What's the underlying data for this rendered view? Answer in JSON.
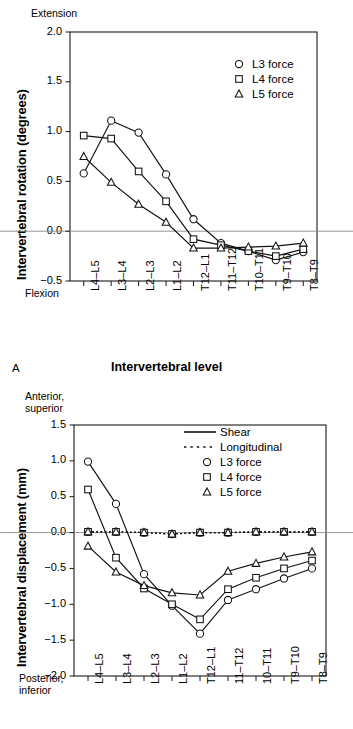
{
  "figure": {
    "panel_a_letter": "A",
    "panel_a_xtitle": "Intervertebral level"
  },
  "chart_data": [
    {
      "id": "panel-a",
      "type": "line",
      "title": "",
      "xlabel": "Intervertebral level",
      "ylabel": "Intervertebral rotation (degrees)",
      "y_axis_top_caption": "Extension",
      "y_axis_bottom_caption": "Flexion",
      "ylim": [
        -0.5,
        2.0
      ],
      "yticks": [
        "2.0",
        "1.5",
        "1.0",
        "0.5",
        "0.0",
        "-0.5"
      ],
      "ytick_values": [
        2.0,
        1.5,
        1.0,
        0.5,
        0.0,
        -0.5
      ],
      "grid": false,
      "zero_line": true,
      "legend_position": "top-right",
      "categories": [
        "L4–L5",
        "L3–L4",
        "L2–L3",
        "L1–L2",
        "T12–L1",
        "T11–T12",
        "T10–T11",
        "T9–T10",
        "T8–T9"
      ],
      "series": [
        {
          "name": "L3 force",
          "marker": "circle",
          "linestyle": "solid",
          "values": [
            0.58,
            1.11,
            0.99,
            0.57,
            0.12,
            -0.12,
            -0.2,
            -0.29,
            -0.21
          ]
        },
        {
          "name": "L4 force",
          "marker": "square",
          "linestyle": "solid",
          "values": [
            0.96,
            0.93,
            0.6,
            0.3,
            -0.08,
            -0.14,
            -0.2,
            -0.25,
            -0.18
          ]
        },
        {
          "name": "L5 force",
          "marker": "triangle",
          "linestyle": "solid",
          "values": [
            0.75,
            0.49,
            0.27,
            0.09,
            -0.17,
            -0.17,
            -0.16,
            -0.15,
            -0.12
          ]
        }
      ]
    },
    {
      "id": "panel-b",
      "type": "line",
      "title": "",
      "xlabel": "Intervertebral level",
      "ylabel": "Intervertebral displacement (mm)",
      "y_axis_top_caption": "Anterior,\nsuperior",
      "y_axis_bottom_caption": "Posterior,\ninferior",
      "ylim": [
        -2.0,
        1.5
      ],
      "yticks": [
        "1.5",
        "1.0",
        "0.5",
        "0.0",
        "-0.5",
        "-1.0",
        "-1.5",
        "-2.0"
      ],
      "ytick_values": [
        1.5,
        1.0,
        0.5,
        0.0,
        -0.5,
        -1.0,
        -1.5,
        -2.0
      ],
      "grid": false,
      "zero_line": true,
      "legend_position": "top-right",
      "categories": [
        "L4–L5",
        "L3–L4",
        "L2–L3",
        "L1–L2",
        "T12–L1",
        "11–T12",
        "10–T11",
        "T9–T10",
        "T8–T9"
      ],
      "series": [
        {
          "name": "Shear, L3 force",
          "marker": "circle",
          "linestyle": "solid",
          "values": [
            0.99,
            0.4,
            -0.58,
            -1.02,
            -1.41,
            -0.94,
            -0.79,
            -0.64,
            -0.5
          ]
        },
        {
          "name": "Shear, L4 force",
          "marker": "square",
          "linestyle": "solid",
          "values": [
            0.6,
            -0.35,
            -0.78,
            -1.0,
            -1.21,
            -0.79,
            -0.63,
            -0.5,
            -0.39
          ]
        },
        {
          "name": "Shear, L5 force",
          "marker": "triangle",
          "linestyle": "solid",
          "values": [
            -0.19,
            -0.55,
            -0.74,
            -0.84,
            -0.87,
            -0.54,
            -0.43,
            -0.34,
            -0.27
          ]
        },
        {
          "name": "Longitudinal, L3 force",
          "marker": "circle",
          "linestyle": "dotted",
          "values": [
            0.01,
            0.01,
            0.0,
            -0.02,
            0.0,
            0.0,
            0.01,
            0.01,
            0.01
          ]
        },
        {
          "name": "Longitudinal, L4 force",
          "marker": "square",
          "linestyle": "dotted",
          "values": [
            0.01,
            0.01,
            0.0,
            -0.02,
            0.0,
            0.0,
            0.01,
            0.01,
            0.01
          ]
        },
        {
          "name": "Longitudinal, L5 force",
          "marker": "triangle",
          "linestyle": "dotted",
          "values": [
            0.01,
            0.01,
            0.0,
            -0.02,
            0.0,
            0.0,
            0.01,
            0.01,
            0.01
          ]
        }
      ]
    }
  ],
  "legend_a": {
    "items": [
      {
        "label": "L3 force",
        "marker": "circle"
      },
      {
        "label": "L4 force",
        "marker": "square"
      },
      {
        "label": "L5 force",
        "marker": "triangle"
      }
    ]
  },
  "legend_b": {
    "items": [
      {
        "label": "Shear",
        "marker": "line-solid"
      },
      {
        "label": "Longitudinal",
        "marker": "line-dotted"
      },
      {
        "label": "L3 force",
        "marker": "circle"
      },
      {
        "label": "L4 force",
        "marker": "square"
      },
      {
        "label": "L5 force",
        "marker": "triangle"
      }
    ]
  }
}
